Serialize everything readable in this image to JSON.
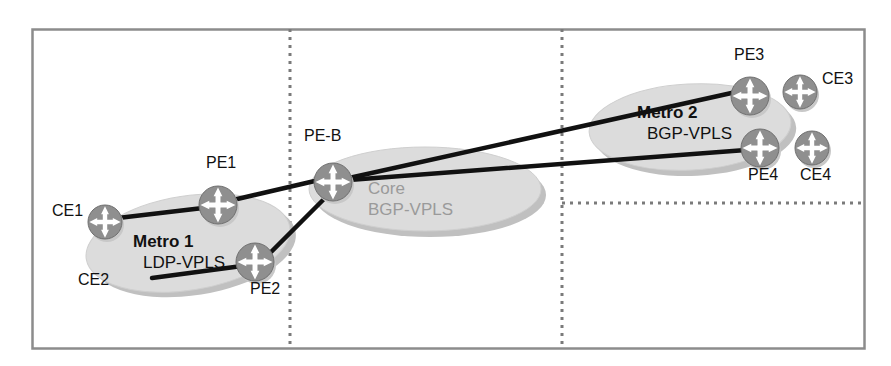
{
  "diagram": {
    "colors": {
      "border": "#8c8c8c",
      "divider": "#7a7a7a",
      "cloud_fill": "#dcdcdc",
      "cloud_shadow": "#c0c0c0",
      "node_fill": "#8f8f8f",
      "node_glyph": "#ffffff",
      "node_shadow": "#c8c8c8",
      "link": "#111111",
      "text_dark": "#111111",
      "text_gray": "#9a9a9a"
    },
    "frame": {
      "x": 32,
      "y": 29,
      "width": 832,
      "height": 319
    },
    "dividers": [
      {
        "name": "divider-left",
        "orientation": "vertical",
        "x": 290,
        "y1": 29,
        "y2": 348
      },
      {
        "name": "divider-right",
        "orientation": "vertical",
        "x": 562,
        "y1": 29,
        "y2": 348
      },
      {
        "name": "divider-metro2-bottom",
        "orientation": "horizontal",
        "y": 203,
        "x1": 562,
        "x2": 863
      }
    ],
    "clouds": [
      {
        "id": "metro1",
        "cx": 188,
        "cy": 243,
        "rx": 103,
        "ry": 47,
        "rotate": -9,
        "label_bold": "Metro 1",
        "label_plain": "LDP-VPLS",
        "label_x": 133,
        "label_y": 233,
        "label_color": "#111111"
      },
      {
        "id": "core",
        "cx": 425,
        "cy": 189,
        "rx": 116,
        "ry": 42,
        "rotate": 0,
        "label_bold": "Core",
        "label_plain": "BGP-VPLS",
        "label_x": 368,
        "label_y": 180,
        "label_color": "#9a9a9a"
      },
      {
        "id": "metro2",
        "cx": 690,
        "cy": 127,
        "rx": 101,
        "ry": 43,
        "rotate": -3,
        "label_bold": "Metro 2",
        "label_plain": "BGP-VPLS",
        "label_x": 637,
        "label_y": 104,
        "label_color": "#111111"
      }
    ],
    "nodes": [
      {
        "id": "ce1",
        "label": "CE1",
        "cx": 105,
        "cy": 222,
        "r": 17,
        "label_x": 52,
        "label_y": 203,
        "label_bold": false
      },
      {
        "id": "pe1",
        "label": "PE1",
        "cx": 218,
        "cy": 205,
        "r": 19,
        "label_x": 206,
        "label_y": 155,
        "label_bold": false
      },
      {
        "id": "pe2",
        "label": "PE2",
        "cx": 255,
        "cy": 262,
        "r": 19,
        "label_x": 250,
        "label_y": 281,
        "label_bold": false
      },
      {
        "id": "ce2",
        "label": "CE2",
        "cx": null,
        "cy": null,
        "r": 0,
        "label_x": 78,
        "label_y": 272,
        "label_bold": false
      },
      {
        "id": "peb",
        "label": "PE-B",
        "cx": 333,
        "cy": 182,
        "r": 19,
        "label_x": 304,
        "label_y": 128,
        "label_bold": false
      },
      {
        "id": "pe3",
        "label": "PE3",
        "cx": 750,
        "cy": 96,
        "r": 19,
        "label_x": 734,
        "label_y": 47,
        "label_bold": false
      },
      {
        "id": "ce3",
        "label": "CE3",
        "cx": 800,
        "cy": 92,
        "r": 17,
        "label_x": 822,
        "label_y": 71,
        "label_bold": false
      },
      {
        "id": "pe4",
        "label": "PE4",
        "cx": 760,
        "cy": 148,
        "r": 19,
        "label_x": 748,
        "label_y": 167,
        "label_bold": false
      },
      {
        "id": "ce4",
        "label": "CE4",
        "cx": 812,
        "cy": 148,
        "r": 17,
        "label_x": 800,
        "label_y": 167,
        "label_bold": false
      }
    ],
    "links": [
      {
        "id": "ce1-pe1",
        "from": "CE1",
        "to": "PE1",
        "x1": 118,
        "y1": 218,
        "x2": 203,
        "y2": 208
      },
      {
        "id": "ce2-pe2",
        "from": "CE2",
        "to": "PE2",
        "x1": 152,
        "y1": 278,
        "x2": 242,
        "y2": 266
      },
      {
        "id": "pe1-peb",
        "from": "PE1",
        "to": "PE-B",
        "x1": 233,
        "y1": 200,
        "x2": 319,
        "y2": 180
      },
      {
        "id": "pe2-peb",
        "from": "PE2",
        "to": "PE-B",
        "x1": 268,
        "y1": 255,
        "x2": 327,
        "y2": 196
      },
      {
        "id": "peb-pe3",
        "from": "PE-B",
        "to": "PE3",
        "x1": 349,
        "y1": 178,
        "x2": 736,
        "y2": 92
      },
      {
        "id": "peb-pe4",
        "from": "PE-B",
        "to": "PE4",
        "x1": 349,
        "y1": 180,
        "x2": 746,
        "y2": 150
      }
    ]
  }
}
